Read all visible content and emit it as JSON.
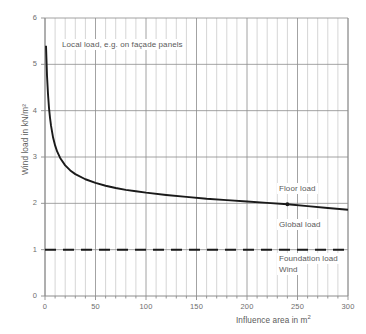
{
  "chart_data": {
    "type": "line",
    "title": "",
    "xlabel": "Influence area in m²",
    "ylabel": "Wind load  in kN/m²",
    "xlim": [
      0,
      300
    ],
    "ylim": [
      0,
      6
    ],
    "xticks": [
      0,
      50,
      100,
      150,
      200,
      250,
      300
    ],
    "xtick_labels": [
      "0",
      "50",
      "100",
      "150",
      "200",
      "250",
      "300"
    ],
    "yticks": [
      0,
      1,
      2,
      3,
      4,
      5,
      6
    ],
    "ytick_labels": [
      "0",
      "1",
      "2",
      "3",
      "4",
      "5",
      "6"
    ],
    "grid": true,
    "grid_minor_x_step": 10,
    "grid_major_y_step": 1,
    "legend_position": "none",
    "series": [
      {
        "name": "Wind load curve",
        "style": "solid",
        "color": "#1a1a1a",
        "x": [
          1,
          2,
          3,
          4,
          5,
          6,
          8,
          10,
          12,
          15,
          20,
          25,
          30,
          40,
          50,
          60,
          70,
          80,
          90,
          100,
          120,
          140,
          160,
          180,
          200,
          220,
          240,
          260,
          280,
          300
        ],
        "y": [
          5.4,
          4.75,
          4.35,
          4.05,
          3.84,
          3.67,
          3.42,
          3.25,
          3.12,
          2.98,
          2.82,
          2.71,
          2.63,
          2.52,
          2.44,
          2.38,
          2.33,
          2.29,
          2.26,
          2.23,
          2.18,
          2.14,
          2.1,
          2.07,
          2.04,
          2.01,
          1.98,
          1.94,
          1.9,
          1.86
        ]
      },
      {
        "name": "Foundation load wind",
        "style": "dashed",
        "color": "#1a1a1a",
        "x": [
          0,
          300
        ],
        "y": [
          1,
          1
        ]
      }
    ],
    "markers": [
      {
        "x": 240,
        "y": 1.98
      }
    ],
    "annotations": [
      {
        "id": "local",
        "text": "Local load, e.g. on façade panels",
        "x": 5,
        "y": 5.42
      },
      {
        "id": "floor",
        "text": "Floor load",
        "x": 249,
        "y": 2.25
      },
      {
        "id": "global",
        "text": "Global load",
        "x": 249,
        "y": 1.6
      },
      {
        "id": "foundation",
        "text": "Foundation load",
        "x": 249,
        "y": 0.97
      },
      {
        "id": "wind",
        "text": "Wind",
        "x": 249,
        "y": 0.78
      }
    ],
    "colors": {
      "curve": "#1a1a1a",
      "grid_major": "#8c8c8c",
      "grid_minor": "#b8b8b8",
      "axis": "#8c8c8c",
      "text": "#5a5a5a"
    }
  }
}
